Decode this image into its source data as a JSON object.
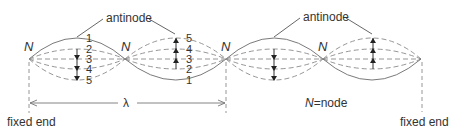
{
  "diagram": {
    "labels": {
      "antinode_left": "antinode",
      "antinode_right": "antinode",
      "node_symbol": "N",
      "legend_symbol": "N",
      "legend_text": "=node",
      "wavelength": "λ",
      "fixed_end_left": "fixed end",
      "fixed_end_right": "fixed end"
    },
    "nodes": [
      {
        "id": "n1",
        "label": "N",
        "x": 29,
        "y": 59
      },
      {
        "id": "n2",
        "label": "N",
        "x": 125,
        "y": 59
      },
      {
        "id": "n3",
        "label": "N",
        "x": 226,
        "y": 59
      },
      {
        "id": "n4",
        "label": "N",
        "x": 323,
        "y": 59
      },
      {
        "id": "n5",
        "label": "N",
        "x": 421,
        "y": 59
      }
    ],
    "segment_1_positions": [
      "1",
      "2",
      "3",
      "4",
      "5"
    ],
    "segment_2_positions": [
      "5",
      "4",
      "3",
      "2",
      "1"
    ],
    "position_order_note": "1 = maximum displacement, 3 = equilibrium, 5 = opposite maximum",
    "wavelength_span": {
      "from_node": "n1",
      "to_node": "n3"
    },
    "colors": {
      "solid_curve": "#7a7a7a",
      "dashed_curve": "#8a8a8a",
      "text": "#333333",
      "background": "#ffffff"
    }
  }
}
